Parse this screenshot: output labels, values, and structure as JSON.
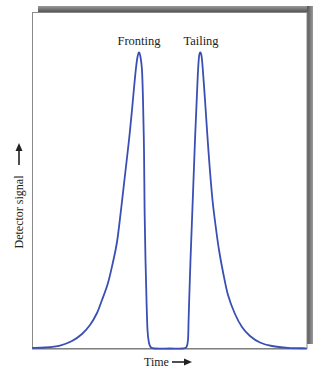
{
  "chart_data": {
    "type": "line",
    "title": "",
    "xlabel": "Time",
    "ylabel": "Detector signal",
    "xlabel_arrow": "right",
    "ylabel_arrow": "up",
    "grid": false,
    "legend": null,
    "ticks": {
      "x": [],
      "y": []
    },
    "annotations": [
      {
        "text": "Fronting",
        "x": 139,
        "y": 41
      },
      {
        "text": "Tailing",
        "x": 201,
        "y": 41
      }
    ],
    "series": [
      {
        "name": "Fronting peak and tailing peak",
        "color": "#3a4fb4",
        "description": "Fronting peak (slow rise, sharp fall) followed by a tailing peak (sharp rise, slow decay)",
        "points_px": [
          [
            33,
            348
          ],
          [
            45,
            347.5
          ],
          [
            60,
            345.5
          ],
          [
            72,
            341
          ],
          [
            82,
            334
          ],
          [
            90,
            325
          ],
          [
            97,
            313
          ],
          [
            102,
            300
          ],
          [
            108,
            283
          ],
          [
            113,
            262
          ],
          [
            117,
            242
          ],
          [
            121,
            210
          ],
          [
            125,
            175
          ],
          [
            129,
            140
          ],
          [
            132,
            110
          ],
          [
            134,
            88
          ],
          [
            136,
            68
          ],
          [
            137.5,
            57
          ],
          [
            139,
            52.5
          ],
          [
            140.5,
            57
          ],
          [
            142,
            70
          ],
          [
            143,
            100
          ],
          [
            144,
            150
          ],
          [
            144.6,
            210
          ],
          [
            145.5,
            260
          ],
          [
            146.5,
            300
          ],
          [
            147.5,
            330
          ],
          [
            149,
            343
          ],
          [
            151,
            347.5
          ],
          [
            155,
            348.5
          ],
          [
            170,
            348.5
          ],
          [
            183,
            348.5
          ],
          [
            186.5,
            347
          ],
          [
            188,
            340
          ],
          [
            188.6,
            320
          ],
          [
            189.2,
            300
          ],
          [
            190.5,
            260
          ],
          [
            192,
            220
          ],
          [
            193.5,
            180
          ],
          [
            195,
            140
          ],
          [
            196.5,
            105
          ],
          [
            197.8,
            75
          ],
          [
            199,
            57
          ],
          [
            200.3,
            52.5
          ],
          [
            201.7,
            57
          ],
          [
            203,
            72
          ],
          [
            205,
            100
          ],
          [
            207,
            130
          ],
          [
            209.5,
            165
          ],
          [
            212.5,
            200
          ],
          [
            215.5,
            225
          ],
          [
            219,
            250
          ],
          [
            223,
            272
          ],
          [
            228,
            295
          ],
          [
            235,
            314
          ],
          [
            242,
            327
          ],
          [
            250,
            336
          ],
          [
            260,
            342.5
          ],
          [
            272,
            346
          ],
          [
            288,
            347.8
          ],
          [
            306,
            348.3
          ]
        ]
      }
    ]
  },
  "labels": {
    "fronting": "Fronting",
    "tailing": "Tailing",
    "x_axis": "Time",
    "y_axis": "Detector signal"
  }
}
